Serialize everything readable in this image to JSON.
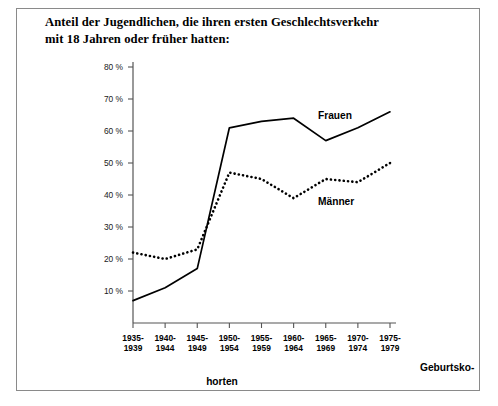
{
  "title": {
    "line1": "Anteil der Jugendlichen, die ihren ersten Geschlechtsverkehr",
    "line2": "mit 18 Jahren oder früher hatten:"
  },
  "axis_captions": {
    "x_caption_top_right": "Geburtsko-",
    "x_caption_bottom": "horten"
  },
  "chart_data": {
    "type": "line",
    "title": "Anteil der Jugendlichen, die ihren ersten Geschlechtsverkehr mit 18 Jahren oder früher hatten:",
    "xlabel": "Geburtskohorten",
    "ylabel": "",
    "ylim": [
      0,
      80
    ],
    "yticks": [
      10,
      20,
      30,
      40,
      50,
      60,
      70,
      80
    ],
    "ytick_labels": [
      "10 %",
      "20 %",
      "30 %",
      "40 %",
      "50 %",
      "60 %",
      "70 %",
      "80 %"
    ],
    "grid": false,
    "legend": "inline-annotations",
    "categories": [
      "1935-\n1939",
      "1940-\n1944",
      "1945-\n1949",
      "1950-\n1954",
      "1955-\n1959",
      "1960-\n1964",
      "1965-\n1969",
      "1970-\n1974",
      "1975-\n1979"
    ],
    "category_lines": [
      [
        "1935-",
        "1939"
      ],
      [
        "1940-",
        "1944"
      ],
      [
        "1945-",
        "1949"
      ],
      [
        "1950-",
        "1954"
      ],
      [
        "1955-",
        "1959"
      ],
      [
        "1960-",
        "1964"
      ],
      [
        "1965-",
        "1969"
      ],
      [
        "1970-",
        "1974"
      ],
      [
        "1975-",
        "1979"
      ]
    ],
    "series": [
      {
        "name": "Frauen",
        "style": "solid",
        "color": "#000000",
        "values": [
          7,
          11,
          17,
          61,
          63,
          64,
          57,
          61,
          66
        ]
      },
      {
        "name": "Männer",
        "style": "dotted",
        "color": "#000000",
        "values": [
          22,
          20,
          23,
          47,
          45,
          39,
          45,
          44,
          50
        ]
      }
    ],
    "annotations": [
      {
        "text": "Frauen",
        "series": "Frauen",
        "x_category": "1960-1964",
        "value_near": 64
      },
      {
        "text": "Männer",
        "series": "Männer",
        "x_category": "1965-1969",
        "value_near": 39
      }
    ]
  }
}
